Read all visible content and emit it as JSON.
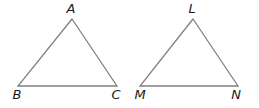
{
  "diagram": {
    "colors": {
      "edge": "#808080",
      "label": "#1a1a1a"
    },
    "triangles": [
      {
        "name": "ABC",
        "vertices": [
          {
            "label": "A",
            "x": 72,
            "y": 19,
            "lx": 71,
            "ly": 13
          },
          {
            "label": "B",
            "x": 18,
            "y": 86,
            "lx": 17,
            "ly": 99
          },
          {
            "label": "C",
            "x": 117,
            "y": 86,
            "lx": 116,
            "ly": 99
          }
        ]
      },
      {
        "name": "LMN",
        "vertices": [
          {
            "label": "L",
            "x": 193,
            "y": 19,
            "lx": 192,
            "ly": 13
          },
          {
            "label": "M",
            "x": 140,
            "y": 86,
            "lx": 140,
            "ly": 99
          },
          {
            "label": "N",
            "x": 238,
            "y": 86,
            "lx": 236,
            "ly": 99
          }
        ]
      }
    ]
  }
}
